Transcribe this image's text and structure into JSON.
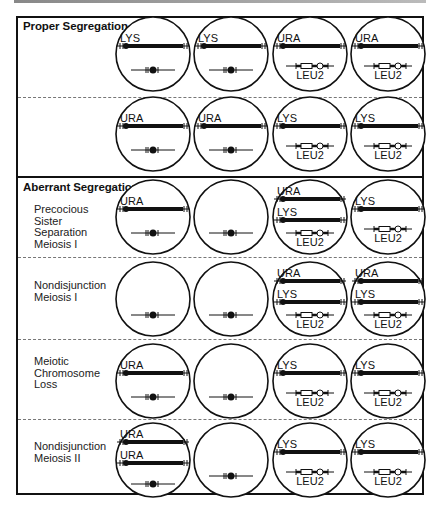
{
  "sections": {
    "proper": {
      "title": "Proper Segregation"
    },
    "aberrant": {
      "title": "Aberrant Segregation"
    }
  },
  "row_labels": {
    "r2": [
      "Precocious",
      "Sister",
      "Separation",
      "Meiosis I"
    ],
    "r3": [
      "Nondisjunction",
      "Meiosis I"
    ],
    "r4": [
      "Meiotic",
      "Chromosome",
      "Loss"
    ],
    "r5": [
      "Nondisjunction",
      "Meiosis II"
    ]
  },
  "gene_labels": {
    "lys": "LYS",
    "ura": "URA",
    "leu2": "LEU2"
  },
  "rows": [
    {
      "id": "proper-1",
      "spores": [
        [
          "LYS",
          "small"
        ],
        [
          "LYS",
          "small"
        ],
        [
          "URA",
          "leu2"
        ],
        [
          "URA",
          "leu2"
        ]
      ]
    },
    {
      "id": "proper-2",
      "spores": [
        [
          "URA",
          "small"
        ],
        [
          "URA",
          "small"
        ],
        [
          "LYS",
          "leu2"
        ],
        [
          "LYS",
          "leu2"
        ]
      ]
    },
    {
      "id": "pss-meiosis-1",
      "spores": [
        [
          "URA",
          "small"
        ],
        [
          "small"
        ],
        [
          "URA",
          "LYS",
          "leu2"
        ],
        [
          "LYS",
          "leu2"
        ]
      ]
    },
    {
      "id": "nondisjunction-meiosis-1",
      "spores": [
        [
          "small"
        ],
        [
          "small"
        ],
        [
          "URA",
          "LYS",
          "leu2"
        ],
        [
          "URA",
          "LYS",
          "leu2"
        ]
      ]
    },
    {
      "id": "meiotic-chromosome-loss",
      "spores": [
        [
          "URA",
          "small"
        ],
        [
          "small"
        ],
        [
          "LYS",
          "leu2"
        ],
        [
          "LYS",
          "leu2"
        ]
      ]
    },
    {
      "id": "nondisjunction-meiosis-2",
      "spores": [
        [
          "URA",
          "URA",
          "small"
        ],
        [
          "small"
        ],
        [
          "LYS",
          "leu2"
        ],
        [
          "LYS",
          "leu2"
        ]
      ]
    }
  ]
}
